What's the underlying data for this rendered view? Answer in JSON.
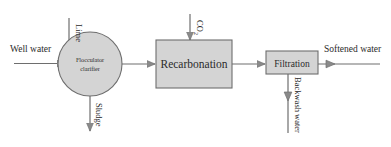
{
  "figure": {
    "background_color": "#ffffff",
    "shape_fill_color": "#d4d4d4",
    "stroke_color": "#6e6e6e",
    "text_color": "#2b2b2b"
  },
  "units": [
    {
      "id": "flocculator-clarifier",
      "shape": "circle",
      "label_line1": "Flocculator",
      "label_line2": "clarifier"
    },
    {
      "id": "recarbonation",
      "shape": "rectangle",
      "label": "Recarbonation"
    },
    {
      "id": "filtration",
      "shape": "rectangle",
      "label": "Filtration"
    }
  ],
  "streams": [
    {
      "id": "well-water",
      "label": "Well water",
      "orientation": "horizontal",
      "direction": "in"
    },
    {
      "id": "lime",
      "label": "Lime",
      "orientation": "vertical",
      "direction": "in"
    },
    {
      "id": "sludge",
      "label": "Sludge",
      "orientation": "vertical",
      "direction": "out"
    },
    {
      "id": "carbon-dioxide",
      "label": "CO",
      "label_subscript": "2",
      "orientation": "vertical",
      "direction": "in"
    },
    {
      "id": "backwash-water",
      "label": "Backwash water",
      "orientation": "vertical",
      "direction": "out"
    },
    {
      "id": "softened-water",
      "label": "Softened water",
      "orientation": "horizontal",
      "direction": "out"
    }
  ]
}
